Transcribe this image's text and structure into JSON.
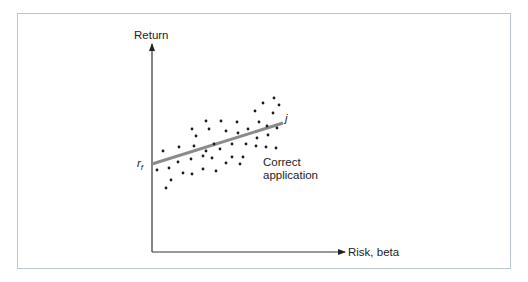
{
  "diagram": {
    "type": "scatter_with_line",
    "y_axis_label": "Return",
    "x_axis_label": "Risk, beta",
    "intercept_label": "r",
    "intercept_subscript": "f",
    "line_label": "j",
    "annotation": [
      "Correct",
      "application"
    ],
    "colors": {
      "frame": "#b9c6cc",
      "axis": "#333333",
      "line": "#8a8a8a",
      "dots": "#1a1a1a"
    }
  },
  "chart_data": {
    "type": "scatter",
    "title": "",
    "xlabel": "Risk, beta",
    "ylabel": "Return",
    "annotations": [
      "r_f",
      "j",
      "Correct application"
    ],
    "line": {
      "name": "j",
      "from_px": [
        152,
        164
      ],
      "to_px": [
        283,
        123
      ]
    },
    "points_px": [
      [
        163,
        151
      ],
      [
        179,
        147
      ],
      [
        192,
        129
      ],
      [
        206,
        121
      ],
      [
        221,
        121
      ],
      [
        237,
        122
      ],
      [
        255,
        111
      ],
      [
        263,
        103
      ],
      [
        274,
        98
      ],
      [
        279,
        105
      ],
      [
        196,
        136
      ],
      [
        209,
        129
      ],
      [
        226,
        131
      ],
      [
        238,
        133
      ],
      [
        248,
        129
      ],
      [
        259,
        122
      ],
      [
        267,
        126
      ],
      [
        273,
        113
      ],
      [
        277,
        128
      ],
      [
        194,
        146
      ],
      [
        206,
        151
      ],
      [
        214,
        144
      ],
      [
        220,
        149
      ],
      [
        232,
        144
      ],
      [
        246,
        144
      ],
      [
        257,
        138
      ],
      [
        268,
        135
      ],
      [
        256,
        146
      ],
      [
        266,
        147
      ],
      [
        276,
        148
      ],
      [
        157,
        170
      ],
      [
        169,
        168
      ],
      [
        178,
        162
      ],
      [
        191,
        159
      ],
      [
        203,
        156
      ],
      [
        212,
        158
      ],
      [
        226,
        163
      ],
      [
        232,
        157
      ],
      [
        240,
        164
      ],
      [
        243,
        157
      ],
      [
        183,
        173
      ],
      [
        192,
        174
      ],
      [
        203,
        169
      ],
      [
        216,
        171
      ],
      [
        171,
        180
      ],
      [
        166,
        188
      ]
    ],
    "grid": false
  }
}
